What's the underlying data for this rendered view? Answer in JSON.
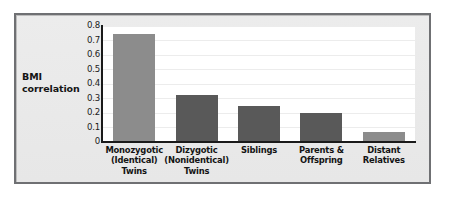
{
  "chart_data": {
    "type": "bar",
    "title": "",
    "xlabel": "",
    "ylabel": "BMI correlation",
    "ylim": [
      0,
      0.8
    ],
    "grid": true,
    "legend": "none",
    "ytick_labels": [
      "0.8",
      "0.7",
      "0.6",
      "0.5",
      "0.4",
      "0.3",
      "0.2",
      "0.1",
      "0"
    ],
    "ytick_values": [
      0.8,
      0.7,
      0.6,
      0.5,
      0.4,
      0.3,
      0.2,
      0.1,
      0
    ],
    "categories": [
      "Monozygotic\n(Identical)\nTwins",
      "Dizygotic\n(Nonidentical)\nTwins",
      "Siblings",
      "Parents &\nOffspring",
      "Distant\nRelatives"
    ],
    "category_lines": [
      [
        "Monozygotic",
        "(Identical)",
        "Twins"
      ],
      [
        "Dizygotic",
        "(Nonidentical)",
        "Twins"
      ],
      [
        "Siblings"
      ],
      [
        "Parents &",
        "Offspring"
      ],
      [
        "Distant",
        "Relatives"
      ]
    ],
    "values": [
      0.74,
      0.32,
      0.245,
      0.2,
      0.065
    ],
    "bar_colors": [
      "#8c8c8c",
      "#595959",
      "#595959",
      "#595959",
      "#8c8c8c"
    ]
  },
  "style": {
    "frame_border_color": "#6f7073",
    "panel_background": "#ececec",
    "plot_background": "#ffffff",
    "axis_color": "#1a1a1a",
    "gridline_color": "#ececec",
    "text_color": "#141414"
  },
  "ylabel_lines": [
    "BMI",
    "correlation"
  ]
}
